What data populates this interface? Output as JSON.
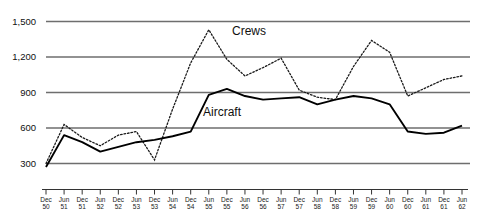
{
  "chart_data": {
    "type": "line",
    "title": "",
    "xlabel": "",
    "ylabel": "",
    "ylim": [
      0,
      1500
    ],
    "yticks": [
      300,
      600,
      900,
      1200,
      1500
    ],
    "ytick_labels": [
      "300",
      "600",
      "900",
      "1,200",
      "1,500"
    ],
    "grid": true,
    "legend_position": "inline-annotations",
    "categories": [
      "Dec\n50",
      "Jun\n51",
      "Dec\n51",
      "Jun\n52",
      "Dec\n52",
      "Jun\n53",
      "Dec\n53",
      "Jun\n54",
      "Dec\n54",
      "Jun\n55",
      "Dec\n55",
      "Jun\n56",
      "Dec\n56",
      "Jun\n57",
      "Dec\n57",
      "Jun\n58",
      "Dec\n58",
      "Jun\n59",
      "Dec\n59",
      "Jun\n60",
      "Dec\n60",
      "Jun\n61",
      "Dec\n61",
      "Jun\n62"
    ],
    "x": [
      "Dec 50",
      "Jun 51",
      "Dec 51",
      "Jun 52",
      "Dec 52",
      "Jun 53",
      "Dec 53",
      "Jun 54",
      "Dec 54",
      "Jun 55",
      "Dec 55",
      "Jun 56",
      "Dec 56",
      "Jun 57",
      "Dec 57",
      "Jun 58",
      "Dec 58",
      "Jun 59",
      "Dec 59",
      "Jun 60",
      "Dec 60",
      "Jun 61",
      "Dec 61",
      "Jun 62"
    ],
    "series": [
      {
        "name": "Crews",
        "style": "dotted",
        "color": "#1a1a1a",
        "values": [
          300,
          630,
          520,
          450,
          540,
          570,
          330,
          760,
          1150,
          1430,
          1180,
          1040,
          1110,
          1190,
          920,
          860,
          840,
          1120,
          1340,
          1240,
          870,
          940,
          1010,
          1040
        ]
      },
      {
        "name": "Aircraft",
        "style": "solid",
        "color": "#000000",
        "values": [
          270,
          540,
          480,
          400,
          440,
          480,
          500,
          530,
          570,
          880,
          930,
          870,
          840,
          850,
          860,
          800,
          840,
          870,
          850,
          800,
          570,
          550,
          560,
          620
        ]
      }
    ],
    "annotations": [
      {
        "text": "Crews",
        "x": "Dec 55",
        "value": 1400
      },
      {
        "text": "Aircraft",
        "x": "Jun 55",
        "value": 700
      }
    ]
  },
  "labels": {
    "crews": "Crews",
    "aircraft": "Aircraft"
  }
}
